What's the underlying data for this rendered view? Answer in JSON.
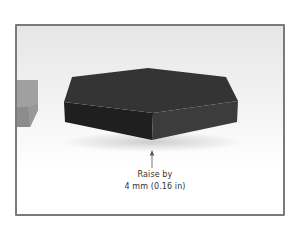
{
  "figure": {
    "annotation": {
      "line1": "Raise by",
      "line2": "4 mm (0.16 in)",
      "arrow_direction": "up"
    },
    "colors": {
      "frame_border": "#7a7a7a",
      "background_top": "#e6e6e6",
      "background_bottom": "#ffffff",
      "hex_top": "#343434",
      "hex_left_face": "#1f1f1f",
      "hex_right_face": "#3c3c3c",
      "neighbor_top": "#a0a0a0",
      "neighbor_side": "#8c8c8c",
      "arrow": "#555555",
      "text": "#333333"
    }
  }
}
